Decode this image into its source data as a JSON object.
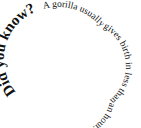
{
  "spiral_text": {
    "heading": "Did you know?",
    "fact": "A gorilla usually gives birth in less than an hour.",
    "text_color": "#111111",
    "background": "#ffffff"
  }
}
